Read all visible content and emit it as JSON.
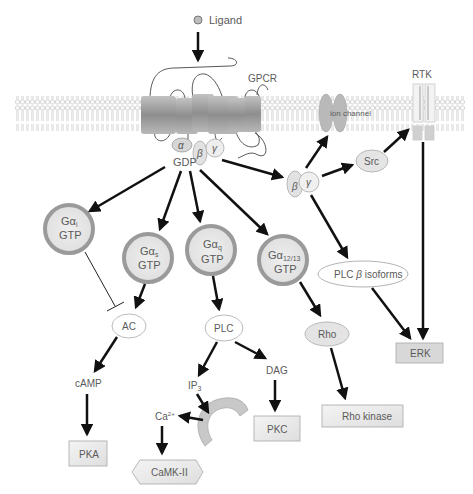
{
  "ligand": {
    "label": "Ligand"
  },
  "membrane": {
    "gpcr_label": "GPCR",
    "ion_channel_label": "ion channel",
    "rtk_label": "RTK"
  },
  "g_protein": {
    "alpha": "α",
    "beta": "β",
    "gamma": "γ",
    "gdp": "GDP"
  },
  "g_alpha_nodes": [
    {
      "id": "gai",
      "symbol": "Gα",
      "sub": "i",
      "state": "GTP"
    },
    {
      "id": "gas",
      "symbol": "Gα",
      "sub": "s",
      "state": "GTP"
    },
    {
      "id": "gaq",
      "symbol": "Gα",
      "sub": "q",
      "state": "GTP"
    },
    {
      "id": "ga1213",
      "symbol": "Gα",
      "sub": "12/13",
      "state": "GTP"
    }
  ],
  "beta_gamma": {
    "beta": "β",
    "gamma": "γ"
  },
  "effectors": {
    "src": "Src",
    "plc_beta_prefix": "PLC ",
    "plc_beta_symbol": "β",
    "plc_beta_suffix": " isoforms",
    "ac": "AC",
    "plc": "PLC",
    "rho": "Rho"
  },
  "second_messengers": {
    "camp": "cAMP",
    "ip3": "IP",
    "ip3_sub": "3",
    "dag": "DAG",
    "ca": "Ca",
    "ca_sup": "2+"
  },
  "kinases": {
    "pka": "PKA",
    "pkc": "PKC",
    "camk": "CaMK-II",
    "rho_kinase": "Rho kinase",
    "erk": "ERK"
  },
  "colors": {
    "arrow": "#111111",
    "node_fill": "#e6e6e6",
    "node_ring": "#9a9a9a",
    "outline": "#b5b5b5",
    "text": "#5a5a5a",
    "membrane_head": "#d8d8d8",
    "gpcr": "#9e9e9e"
  }
}
